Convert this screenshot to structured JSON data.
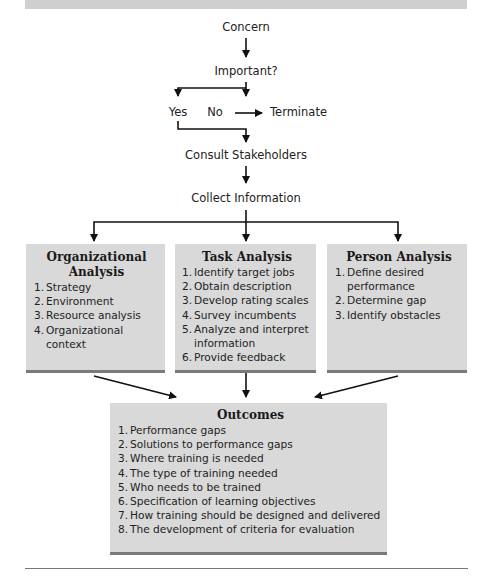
{
  "flow": {
    "concern": "Concern",
    "important": "Important?",
    "yes": "Yes",
    "no": "No",
    "terminate": "Terminate",
    "consult": "Consult Stakeholders",
    "collect": "Collect Information"
  },
  "boxes": {
    "organizational": {
      "title_line1": "Organizational",
      "title_line2": "Analysis",
      "items": [
        {
          "num": "1.",
          "text": "Strategy"
        },
        {
          "num": "2.",
          "text": "Environment"
        },
        {
          "num": "3.",
          "text": "Resource analysis"
        },
        {
          "num": "4.",
          "text": "Organizational context"
        }
      ]
    },
    "task": {
      "title": "Task Analysis",
      "items": [
        {
          "num": "1.",
          "text": "Identify target jobs"
        },
        {
          "num": "2.",
          "text": "Obtain description"
        },
        {
          "num": "3.",
          "text": "Develop rating scales"
        },
        {
          "num": "4.",
          "text": "Survey incumbents"
        },
        {
          "num": "5.",
          "text": "Analyze and interpret information"
        },
        {
          "num": "6.",
          "text": "Provide feedback"
        }
      ]
    },
    "person": {
      "title": "Person Analysis",
      "items": [
        {
          "num": "1.",
          "text": "Define desired performance"
        },
        {
          "num": "2.",
          "text": "Determine gap"
        },
        {
          "num": "3.",
          "text": "Identify obstacles"
        }
      ]
    },
    "outcomes": {
      "title": "Outcomes",
      "items": [
        {
          "num": "1.",
          "text": "Performance gaps"
        },
        {
          "num": "2.",
          "text": "Solutions to performance gaps"
        },
        {
          "num": "3.",
          "text": "Where training is needed"
        },
        {
          "num": "4.",
          "text": "The type of training needed"
        },
        {
          "num": "5.",
          "text": "Who needs to be trained"
        },
        {
          "num": "6.",
          "text": "Specification of learning objectives"
        },
        {
          "num": "7.",
          "text": "How training should be designed and delivered"
        },
        {
          "num": "8.",
          "text": "The development of criteria for evaluation"
        }
      ]
    }
  },
  "colors": {
    "box_fill": "#d9d9d9",
    "box_shadow": "#7a7a7a",
    "top_bar": "#cfcfcf",
    "arrow": "#111111"
  }
}
